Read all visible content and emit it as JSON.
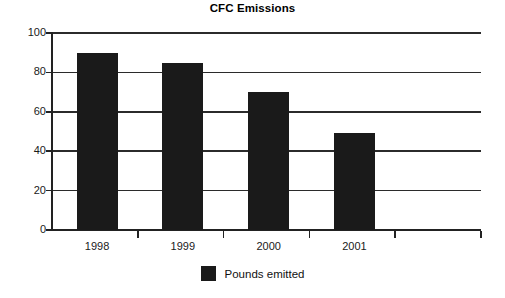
{
  "chart_data": {
    "type": "bar",
    "title": "CFC Emissions",
    "xlabel": "",
    "ylabel": "",
    "categories": [
      "1998",
      "1999",
      "2000",
      "2001"
    ],
    "values": [
      90,
      85,
      70,
      49
    ],
    "series": [
      {
        "name": "Pounds emitted",
        "values": [
          90,
          85,
          70,
          49
        ],
        "color": "#1a1a1a"
      }
    ],
    "ylim": [
      0,
      100
    ],
    "yticks": [
      0,
      20,
      40,
      60,
      80,
      100
    ],
    "ytick_labels": [
      "0",
      "20",
      "40",
      "60",
      "80",
      "100"
    ],
    "grid": true,
    "grid_axis": "y",
    "legend": {
      "position": "bottom-center",
      "entries": [
        {
          "label": "Pounds emitted",
          "color": "#1a1a1a"
        }
      ]
    },
    "axis_color": "#222222",
    "background": "#ffffff"
  }
}
